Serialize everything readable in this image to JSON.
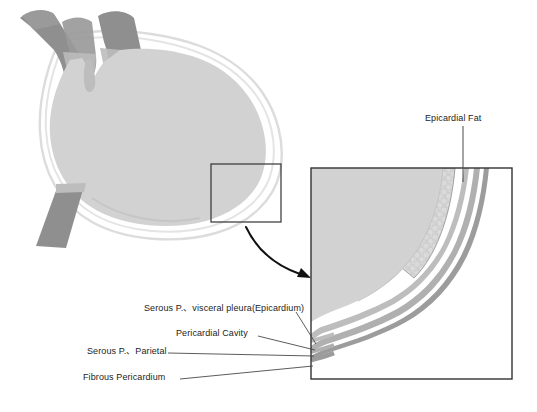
{
  "figure": {
    "background_color": "#ffffff"
  },
  "labels": {
    "epicardial_fat": "Epicardial Fat",
    "serous_visceral": "Serous P.、visceral pleura(Epicardium)",
    "pericardial_cavity": "Pericardial Cavity",
    "serous_parietal": "Serous P.、Parietal",
    "fibrous_pericardium": "Fibrous Pericardium"
  },
  "colors": {
    "myocardium": "#d2d2d2",
    "heart_chamber": "#cfcfcf",
    "great_vessel": "#8f8f8f",
    "vessel_light": "#b4b4b4",
    "epicardial_fat": "#cacaca",
    "fat_outline": "#9a9a9a",
    "visceral_serous": "#bdbdbd",
    "pericardial_cavity": "#ffffff",
    "parietal_serous": "#b0b0b0",
    "fibrous_pericardium": "#9c9c9c",
    "outline_faint": "#d9d9d9",
    "box_stroke": "#333333",
    "leader_line": "#4a4a4a",
    "arrow": "#111111",
    "text": "#1c1c1c"
  },
  "regions": {
    "overview": {
      "name": "heart-overview",
      "description": "Whole heart with great vessels and pericardial outline"
    },
    "callout_box": {
      "name": "callout-box",
      "x": 211,
      "y": 164,
      "width": 70,
      "height": 58
    },
    "detail_inset": {
      "name": "detail-inset",
      "x": 311,
      "y": 168,
      "width": 201,
      "height": 211,
      "description": "Magnified view of pericardial layer stack at heart apex"
    },
    "arrow": {
      "name": "magnify-arrow",
      "from_x": 245,
      "from_y": 226,
      "to_x": 310,
      "to_y": 277
    }
  },
  "layer_stack": [
    {
      "name": "myocardium",
      "label": "Myocardium / heart wall"
    },
    {
      "name": "epicardial-fat",
      "label": "Epicardial Fat"
    },
    {
      "name": "visceral-serous-pericardium",
      "label": "Serous P.、visceral pleura(Epicardium)"
    },
    {
      "name": "pericardial-cavity",
      "label": "Pericardial Cavity"
    },
    {
      "name": "parietal-serous-pericardium",
      "label": "Serous P.、Parietal"
    },
    {
      "name": "fibrous-pericardium",
      "label": "Fibrous Pericardium"
    }
  ]
}
